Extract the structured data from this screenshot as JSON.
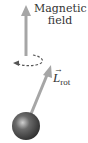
{
  "diagram": {
    "field_label_line1": "Magnetic",
    "field_label_line2": "field",
    "angular_momentum_symbol": "L",
    "angular_momentum_subscript": "rot",
    "vector_arrow": "→",
    "colors": {
      "arrow": "#a6a6a6",
      "dashed": "#555555",
      "sphere_dark": "#3a3a3a",
      "sphere_light": "#bdbdbd",
      "text": "#333333"
    }
  }
}
